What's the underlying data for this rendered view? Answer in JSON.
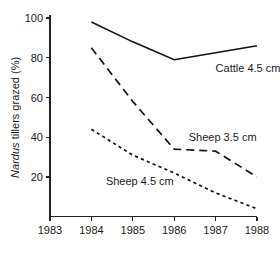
{
  "chart_data": {
    "type": "line",
    "title": "",
    "xlabel": "",
    "ylabel": "Nardus tillers grazed (%)",
    "ylabel_italic_word": "Nardus",
    "ylabel_rest": " tillers grazed (%)",
    "xlim": [
      1983,
      1988
    ],
    "ylim": [
      0,
      100
    ],
    "grid": false,
    "legend_position": "inline-annotations",
    "x_ticks": [
      "1983",
      "1984",
      "1985",
      "1986",
      "1987",
      "1988"
    ],
    "x_tick_values": [
      1983,
      1984,
      1985,
      1986,
      1987,
      1988
    ],
    "y_ticks": [
      "20",
      "40",
      "60",
      "80",
      "100"
    ],
    "y_tick_values": [
      20,
      40,
      60,
      80,
      100
    ],
    "series": [
      {
        "name": "Cattle 4.5 cm",
        "style": "solid",
        "x": [
          1984,
          1985,
          1986,
          1987,
          1988
        ],
        "values": [
          98,
          88,
          79,
          82.5,
          86
        ]
      },
      {
        "name": "Sheep 3.5 cm",
        "style": "long-dashed",
        "x": [
          1984,
          1985,
          1986,
          1987,
          1988
        ],
        "values": [
          85,
          58,
          34,
          33,
          20
        ]
      },
      {
        "name": "Sheep 4.5 cm",
        "style": "short-dashed",
        "x": [
          1984,
          1985,
          1986,
          1987,
          1988
        ],
        "values": [
          44,
          31,
          22,
          12,
          4
        ]
      }
    ],
    "annotations": [
      {
        "text": "Cattle 4.5 cm",
        "x": 1987.0,
        "y": 73
      },
      {
        "text": "Sheep 3.5 cm",
        "x": 1986.35,
        "y": 38
      },
      {
        "text": "Sheep 4.5 cm",
        "x": 1984.35,
        "y": 16
      }
    ]
  }
}
